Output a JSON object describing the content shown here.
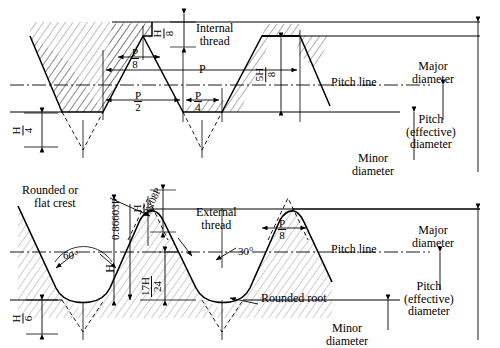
{
  "diagram": {
    "type": "engineering-drawing",
    "sections": [
      {
        "id": "internal",
        "label": "Internal\nthread"
      },
      {
        "id": "external",
        "label": "External\nthread"
      }
    ]
  },
  "labels": {
    "internal_thread_l1": "Internal",
    "internal_thread_l2": "thread",
    "external_thread_l1": "External",
    "external_thread_l2": "thread",
    "pitch_line_top": "Pitch line",
    "pitch_line_bottom": "Pitch line",
    "major_diameter_top_l1": "Major",
    "major_diameter_top_l2": "diameter",
    "pitch_eff_top_l1": "Pitch",
    "pitch_eff_top_l2": "(effective)",
    "pitch_eff_top_l3": "diameter",
    "minor_diameter_top_l1": "Minor",
    "minor_diameter_top_l2": "diameter",
    "major_diameter_bot_l1": "Major",
    "major_diameter_bot_l2": "diameter",
    "pitch_eff_bot_l1": "Pitch",
    "pitch_eff_bot_l2": "(effective)",
    "pitch_eff_bot_l3": "diameter",
    "minor_diameter_bot_l1": "Minor",
    "minor_diameter_bot_l2": "diameter",
    "rounded_or_l1": "Rounded or",
    "rounded_or_l2": "flat crest",
    "rounded_root": "Rounded root"
  },
  "dimensions": {
    "pitch_P": "P",
    "H_over_8_num": "H",
    "H_over_8_den": "8",
    "P_over_8_top_num": "P",
    "P_over_8_top_den": "8",
    "P_over_2_num": "P",
    "P_over_2_den": "2",
    "P_over_4_num": "P",
    "P_over_4_den": "4",
    "H_over_4_num": "H",
    "H_over_4_den": "4",
    "five_H_over_8_num": "5H",
    "five_H_over_8_den": "8",
    "H_over_8_bot_num": "H",
    "H_over_8_bot_den": "8",
    "P_over_8_bot_num": "P",
    "P_over_8_bot_den": "8",
    "H_over_6_num": "H",
    "H_over_6_den": "6",
    "seventeen_H_over_24_num": "17H",
    "seventeen_H_over_24_den": "24",
    "height_H": "H",
    "depth_086603P": "0.86603P",
    "root_radius_0108P": "0.108P",
    "angle_60": "60°",
    "angle_30": "30°"
  },
  "colors": {
    "ink": "#000000",
    "hatch": "#1a1a1a",
    "background": "#ffffff"
  }
}
